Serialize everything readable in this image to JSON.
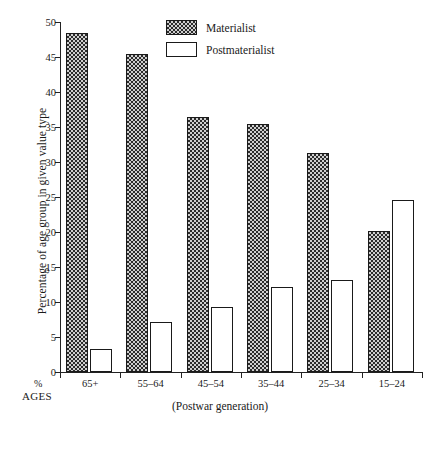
{
  "chart_data": {
    "type": "bar",
    "title": "",
    "xlabel": "(Postwar generation)",
    "ylabel": "Percentage of age group in given value type",
    "categories": [
      "65+",
      "55–64",
      "45–54",
      "35–44",
      "25–34",
      "15–24"
    ],
    "series": [
      {
        "name": "Materialist",
        "values": [
          48.5,
          45.5,
          36.4,
          35.4,
          31.3,
          20.1
        ]
      },
      {
        "name": "Postmaterialist",
        "values": [
          3.3,
          7.1,
          9.3,
          12.2,
          13.1,
          24.6
        ]
      }
    ],
    "ylim": [
      0,
      50
    ],
    "yticks": [
      0,
      5,
      10,
      15,
      20,
      25,
      30,
      35,
      40,
      45,
      50
    ],
    "ytick_labels": [
      "0",
      "5",
      "10",
      "15",
      "20",
      "25",
      "30",
      "35",
      "40",
      "45",
      "50"
    ],
    "grid": false,
    "legend_position": "top-center"
  },
  "axis": {
    "y_title": "Percentage of age group in given value type",
    "x_caption": "(Postwar generation)",
    "corner_percent": "%",
    "corner_ages": "AGES"
  },
  "legend": {
    "entries": [
      {
        "label": "Materialist",
        "swatch": "hatched-gray",
        "color": "#2b2b2b"
      },
      {
        "label": "Postmaterialist",
        "swatch": "white-outline",
        "color": "#ffffff"
      }
    ]
  },
  "colors": {
    "ink": "#1a1a1a",
    "materialist_fill": "#cfcfcf",
    "materialist_hatch": "#2b2b2b",
    "postmaterialist_fill": "#ffffff",
    "background": "#ffffff"
  }
}
